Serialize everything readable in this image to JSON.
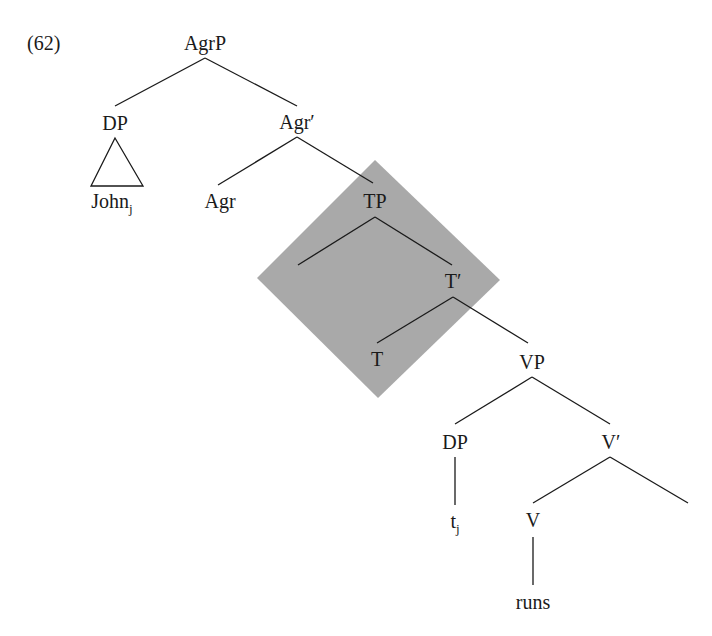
{
  "example_number": "(62)",
  "highlight": {
    "color": "#a9a9a9",
    "points": [
      [
        375,
        160
      ],
      [
        500,
        280
      ],
      [
        378,
        398
      ],
      [
        257,
        278
      ]
    ]
  },
  "nodes": [
    {
      "id": "agrp",
      "label": "AgrP",
      "x": 205,
      "y": 50
    },
    {
      "id": "dp1",
      "label": "DP",
      "x": 115,
      "y": 130
    },
    {
      "id": "agrbar",
      "label": "Agr′",
      "x": 297,
      "y": 129
    },
    {
      "id": "john",
      "label": "John",
      "sub": "j",
      "x": 112,
      "y": 208
    },
    {
      "id": "agr",
      "label": "Agr",
      "x": 220,
      "y": 208
    },
    {
      "id": "tp",
      "label": "TP",
      "x": 375,
      "y": 208
    },
    {
      "id": "tbar",
      "label": "T′",
      "x": 453,
      "y": 288
    },
    {
      "id": "t",
      "label": "T",
      "x": 377,
      "y": 366
    },
    {
      "id": "vp",
      "label": "VP",
      "x": 532,
      "y": 369
    },
    {
      "id": "dp2",
      "label": "DP",
      "x": 455,
      "y": 449
    },
    {
      "id": "vbar",
      "label": "V′",
      "x": 611,
      "y": 449
    },
    {
      "id": "trace",
      "label": "t",
      "sub": "j",
      "x": 455,
      "y": 528
    },
    {
      "id": "v",
      "label": "V",
      "x": 533,
      "y": 527
    },
    {
      "id": "runs",
      "label": "runs",
      "x": 533,
      "y": 609
    }
  ],
  "edges": [
    [
      205,
      58,
      115,
      106
    ],
    [
      205,
      58,
      297,
      106
    ],
    [
      297,
      137,
      218,
      185
    ],
    [
      297,
      137,
      373,
      183
    ],
    [
      375,
      217,
      298,
      265
    ],
    [
      375,
      217,
      452,
      265
    ],
    [
      453,
      297,
      377,
      343
    ],
    [
      453,
      297,
      528,
      343
    ],
    [
      532,
      377,
      455,
      424
    ],
    [
      532,
      377,
      610,
      424
    ],
    [
      455,
      457,
      455,
      505
    ],
    [
      610,
      457,
      533,
      503
    ],
    [
      610,
      457,
      688,
      503
    ],
    [
      533,
      537,
      533,
      585
    ]
  ],
  "triangle": {
    "apex": [
      115,
      138
    ],
    "left": [
      91,
      186
    ],
    "right": [
      143,
      186
    ]
  }
}
